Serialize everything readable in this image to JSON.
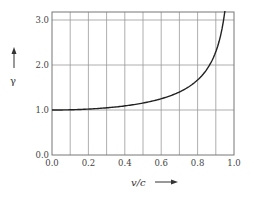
{
  "chart_data": {
    "type": "line",
    "title": "",
    "xlabel": "v/c",
    "ylabel": "γ",
    "xlim": [
      0.0,
      1.0
    ],
    "ylim": [
      0.0,
      3.2
    ],
    "grid": true,
    "legend": null,
    "x_ticks": [
      "0.0",
      "0.2",
      "0.4",
      "0.6",
      "0.8",
      "1.0"
    ],
    "y_ticks": [
      "0.0",
      "1.0",
      "2.0",
      "3.0"
    ],
    "series": [
      {
        "name": "γ = 1/√(1 − v²/c²)",
        "x": [
          0.0,
          0.1,
          0.2,
          0.3,
          0.4,
          0.5,
          0.6,
          0.7,
          0.8,
          0.85,
          0.9,
          0.93,
          0.95
        ],
        "y": [
          1.0,
          1.005,
          1.021,
          1.048,
          1.091,
          1.155,
          1.25,
          1.4,
          1.667,
          1.898,
          2.294,
          2.72,
          3.2
        ]
      }
    ]
  },
  "labels": {
    "xlabel": "v/c",
    "ylabel": "γ",
    "x_ticks": [
      "0.0",
      "0.2",
      "0.4",
      "0.6",
      "0.8",
      "1.0"
    ],
    "y_ticks": [
      "0.0",
      "1.0",
      "2.0",
      "3.0"
    ]
  }
}
